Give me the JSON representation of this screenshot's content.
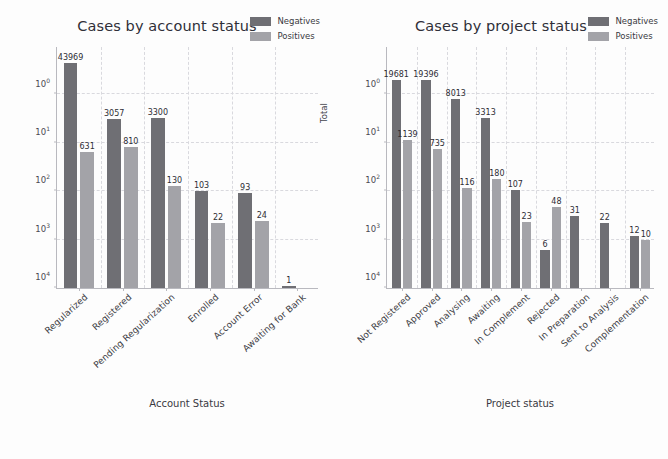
{
  "figure": {
    "background": "#fdfdfd",
    "negatives_color": "#6f6f74",
    "positives_color": "#a3a3a8"
  },
  "ytick_labels": [
    "10",
    "10",
    "10",
    "10",
    "10"
  ],
  "ytick_exponents": [
    "4",
    "3",
    "2",
    "1",
    "0"
  ],
  "legend": {
    "negatives": "Negatives",
    "positives": "Positives"
  },
  "chart_data": [
    {
      "type": "bar",
      "title": "Cases by account status",
      "xlabel": "Account Status",
      "ylabel": "Total",
      "yscale": "log",
      "ylim": [
        1,
        100000
      ],
      "yticks": [
        1,
        10,
        100,
        1000,
        10000
      ],
      "grid": true,
      "legend_position": "upper right",
      "categories": [
        "Regularized",
        "Registered",
        "Pending Regularization",
        "Enrolled",
        "Account Error",
        "Awaiting for Bank"
      ],
      "series": [
        {
          "name": "Negatives",
          "values": [
            43969,
            3057,
            3300,
            103,
            93,
            1
          ]
        },
        {
          "name": "Positives",
          "values": [
            631,
            810,
            130,
            22,
            24,
            null
          ]
        }
      ]
    },
    {
      "type": "bar",
      "title": "Cases by project status",
      "xlabel": "Project status",
      "ylabel": "Total",
      "yscale": "log",
      "ylim": [
        1,
        100000
      ],
      "yticks": [
        1,
        10,
        100,
        1000,
        10000
      ],
      "grid": true,
      "legend_position": "upper right",
      "categories": [
        "Not Registered",
        "Approved",
        "Analysing",
        "Awaiting",
        "In Complement",
        "Rejected",
        "In Preparation",
        "Sent to Analysis",
        "Complementation"
      ],
      "series": [
        {
          "name": "Negatives",
          "values": [
            19681,
            19396,
            8013,
            3313,
            107,
            6,
            31,
            22,
            12
          ]
        },
        {
          "name": "Positives",
          "values": [
            1139,
            735,
            116,
            180,
            23,
            48,
            null,
            null,
            10
          ]
        }
      ]
    }
  ]
}
